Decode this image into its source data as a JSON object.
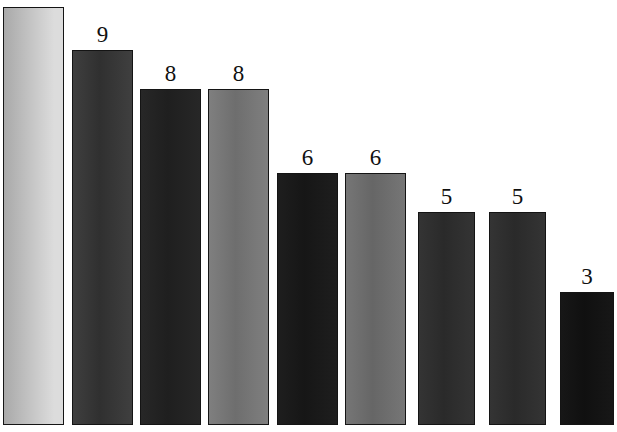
{
  "note": {
    "text": "Answer: page 125"
  },
  "chart_data": {
    "type": "bar",
    "title": "",
    "xlabel": "",
    "ylabel": "",
    "grid": false,
    "legend": null,
    "ylim": [
      0,
      11
    ],
    "categories": [
      "1",
      "2",
      "3",
      "4",
      "5",
      "6",
      "7",
      "8",
      "9"
    ],
    "values": [
      11,
      9,
      8,
      8,
      6,
      6,
      5,
      5,
      3
    ],
    "labels_shown": [
      "",
      "9",
      "8",
      "8",
      "6",
      "6",
      "5",
      "5",
      "3"
    ],
    "bars": [
      {
        "label": "",
        "value": 11,
        "x": 3,
        "width": 61,
        "top": 7,
        "fill_start": "#a9a9a9",
        "fill_end": "#dcdcdc",
        "border": "#141414"
      },
      {
        "label": "9",
        "value": 9,
        "x": 72,
        "width": 61,
        "top": 50,
        "fill_start": "#3f3f3f",
        "fill_end": "#303030",
        "border": "#141414"
      },
      {
        "label": "8",
        "value": 8,
        "x": 140,
        "width": 61,
        "top": 89,
        "fill_start": "#272727",
        "fill_end": "#1f1f1f",
        "border": "#141414"
      },
      {
        "label": "8",
        "value": 8,
        "x": 208,
        "width": 61,
        "top": 89,
        "fill_start": "#7f7f7f",
        "fill_end": "#6e6e6e",
        "border": "#141414"
      },
      {
        "label": "6",
        "value": 6,
        "x": 277,
        "width": 61,
        "top": 173,
        "fill_start": "#1e1e1e",
        "fill_end": "#161616",
        "border": "#141414"
      },
      {
        "label": "6",
        "value": 6,
        "x": 345,
        "width": 61,
        "top": 173,
        "fill_start": "#767676",
        "fill_end": "#666666",
        "border": "#141414"
      },
      {
        "label": "5",
        "value": 5,
        "x": 418,
        "width": 57,
        "top": 212,
        "fill_start": "#343434",
        "fill_end": "#2a2a2a",
        "border": "#141414"
      },
      {
        "label": "5",
        "value": 5,
        "x": 489,
        "width": 57,
        "top": 212,
        "fill_start": "#343434",
        "fill_end": "#2a2a2a",
        "border": "#141414"
      },
      {
        "label": "3",
        "value": 3,
        "x": 560,
        "width": 54,
        "top": 292,
        "fill_start": "#171717",
        "fill_end": "#101010",
        "border": "#141414"
      }
    ],
    "baseline_y": 425,
    "background": "#ffffff"
  }
}
